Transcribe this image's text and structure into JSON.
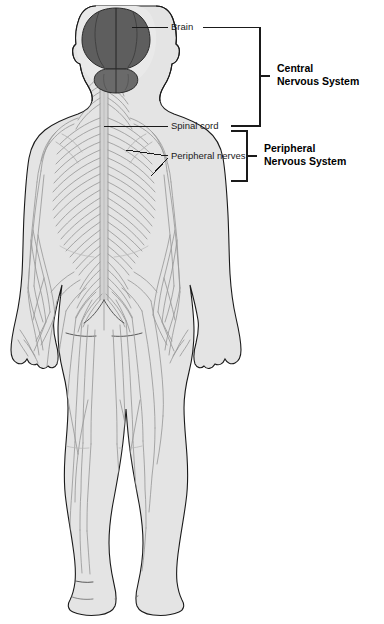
{
  "figure": {
    "view": "posterior full-body view",
    "background_color": "#ffffff"
  },
  "labels": {
    "brain": "Brain",
    "spinal_cord": "Spinal cord",
    "peripheral_nerves": "Peripheral nerves",
    "central_nervous_system_line1": "Central",
    "central_nervous_system_line2": "Nervous System",
    "peripheral_nervous_system_line1": "Peripheral",
    "peripheral_nervous_system_line2": "Nervous System"
  },
  "colors": {
    "body_fill": "#e4e4e4",
    "body_outline": "#1a1a1a",
    "brain_fill": "#5e5e5e",
    "brain_outline": "#2a2a2a",
    "nerve_stroke": "#9a9a9a",
    "spinal_cord_fill": "#d2d2d2",
    "label_text": "#1a1a1a",
    "leader_line": "#1a1a1a"
  },
  "structures": [
    {
      "name": "brain",
      "system": "Central Nervous System"
    },
    {
      "name": "spinal cord",
      "system": "Central Nervous System"
    },
    {
      "name": "peripheral nerves",
      "system": "Peripheral Nervous System"
    }
  ]
}
